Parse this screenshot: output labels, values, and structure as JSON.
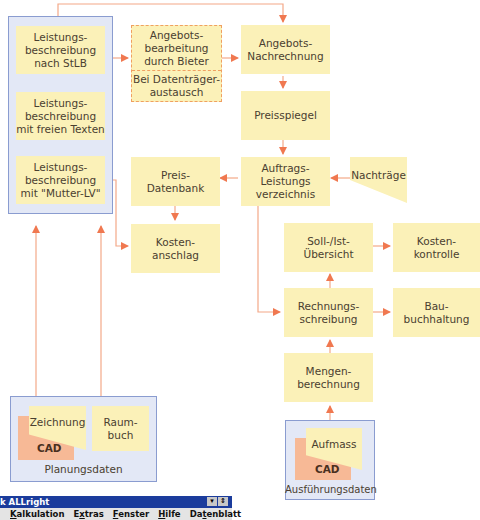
{
  "diagram": {
    "left_group": {
      "items": [
        {
          "label": "Leistungs-\nbeschreibung\nnach StLB"
        },
        {
          "label": "Leistungs-\nbeschreibung\nmit freien Texten"
        },
        {
          "label": "Leistungs-\nbeschreibung\nmit \"Mutter-LV\""
        }
      ]
    },
    "angebotsbearbeitung": {
      "top": "Angebots-\nbearbeitung\ndurch Bieter",
      "bottom": "Bei Datenträger-\naustausch"
    },
    "angebots_nachrechnung": "Angebots-\nNachrechnung",
    "preisspiegel": "Preisspiegel",
    "auftrags_lv": "Auftrags-\nLeistungs\nverzeichnis",
    "nachtraege": "Nachträge",
    "preis_datenbank": "Preis-\nDatenbank",
    "kostenanschlag": "Kosten-\nanschlag",
    "soll_ist": "Soll-/Ist-\nÜbersicht",
    "kostenkontrolle": "Kosten-\nkontrolle",
    "rechnungsschreibung": "Rechnungs-\nschreibung",
    "bauburhaltung": "Bau-\nbuchhaltung",
    "mengenberechnung": "Mengen-\nberechnung",
    "planungsdaten": {
      "zeichnung": "Zeichnung",
      "cad": "CAD",
      "raumbuch": "Raum-\nbuch",
      "label": "Planungsdaten"
    },
    "ausfuehrungsdaten": {
      "aufmass": "Aufmass",
      "cad": "CAD",
      "label": "Ausführungsdaten"
    },
    "colors": {
      "box_fill": "#fbf1b8",
      "group_fill": "#e3e8f6",
      "group_border": "#8a9cd0",
      "arrow": "#f07850",
      "cad_fill": "#f7b996"
    }
  },
  "window": {
    "title": "k ALLright",
    "controls": [
      "▾",
      "⇕"
    ],
    "menu": [
      {
        "label": "Kalkulation",
        "prefix": "",
        "ul": "K",
        "rest": "alkulation"
      },
      {
        "label": "Extras",
        "prefix": "E",
        "ul": "x",
        "rest": "tras"
      },
      {
        "label": "Fenster",
        "prefix": "",
        "ul": "F",
        "rest": "enster"
      },
      {
        "label": "Hilfe",
        "prefix": "",
        "ul": "H",
        "rest": "ilfe"
      },
      {
        "label": "Datenblatt",
        "prefix": "Da",
        "ul": "t",
        "rest": "enblatt"
      }
    ]
  }
}
